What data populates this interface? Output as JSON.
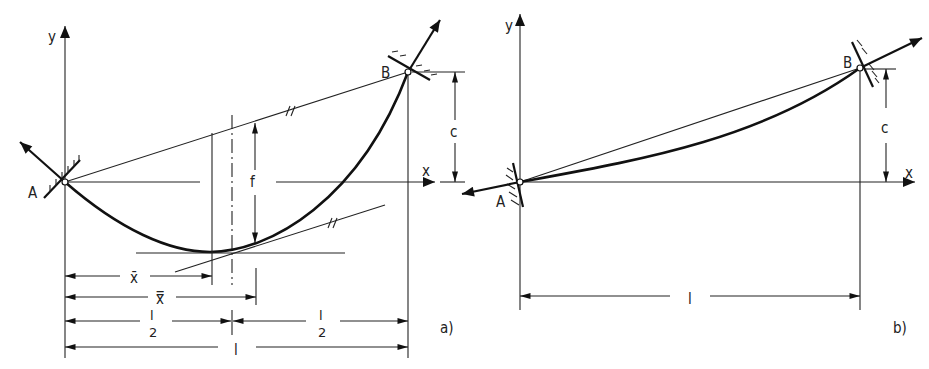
{
  "figure": {
    "panel_a": {
      "caption": "a)",
      "labels": {
        "y_axis": "y",
        "x_axis": "x",
        "point_a": "A",
        "point_b": "B",
        "height_diff": "c",
        "sag": "f",
        "x_bar": "x̄",
        "x_double_bar": "x̿",
        "half_span_num": "l",
        "half_span_den": "2",
        "half_span_num_2": "l",
        "half_span_den_2": "2",
        "span": "l",
        "parallel_mark_1": "//",
        "parallel_mark_2": "//"
      }
    },
    "panel_b": {
      "caption": "b)",
      "labels": {
        "y_axis": "y",
        "x_axis": "x",
        "point_a": "A",
        "point_b": "B",
        "height_diff": "c",
        "span": "l"
      }
    }
  }
}
